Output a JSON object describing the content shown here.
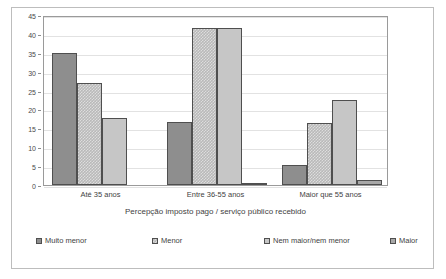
{
  "chart_data": {
    "type": "bar",
    "title": "",
    "xlabel": "Percepção imposto pago / serviço público recebido",
    "ylabel": "",
    "categories": [
      "Até 35 anos",
      "Entre 36-55 anos",
      "Maior que 55 anos"
    ],
    "series": [
      {
        "name": "Muito menor",
        "values": [
          35,
          16.8,
          5.4
        ],
        "color": "#8e8e8e"
      },
      {
        "name": "Menor",
        "values": [
          26.9,
          41.6,
          16.5
        ],
        "color": "#b9b9b9"
      },
      {
        "name": "Nem maior/nem menor",
        "values": [
          17.8,
          41.6,
          22.4
        ],
        "color": "#c6c6c6"
      },
      {
        "name": "Maior",
        "values": [
          0,
          0.4,
          1.3
        ],
        "color": "#a8a8a8"
      }
    ],
    "ylim": [
      0,
      45
    ],
    "yticks": [
      0,
      5,
      10,
      15,
      20,
      25,
      30,
      35,
      40,
      45
    ],
    "ytick_labels": [
      "0",
      "5",
      "10",
      "15",
      "20",
      "25",
      "30",
      "35",
      "40",
      "45"
    ],
    "grid": true,
    "legend_position": "bottom"
  },
  "axis": {
    "y_ticks": [
      "45",
      "40",
      "35",
      "30",
      "25",
      "20",
      "15",
      "10",
      "5",
      "0"
    ]
  },
  "categories": {
    "c0": "Até 35 anos",
    "c1": "Entre 36-55 anos",
    "c2": "Maior que 55 anos"
  },
  "legend": {
    "l0": "Muito menor",
    "l1": "Menor",
    "l2": "Nem maior/nem menor",
    "l3": "Maior"
  },
  "x_title": "Percepção imposto pago / serviço público recebido"
}
